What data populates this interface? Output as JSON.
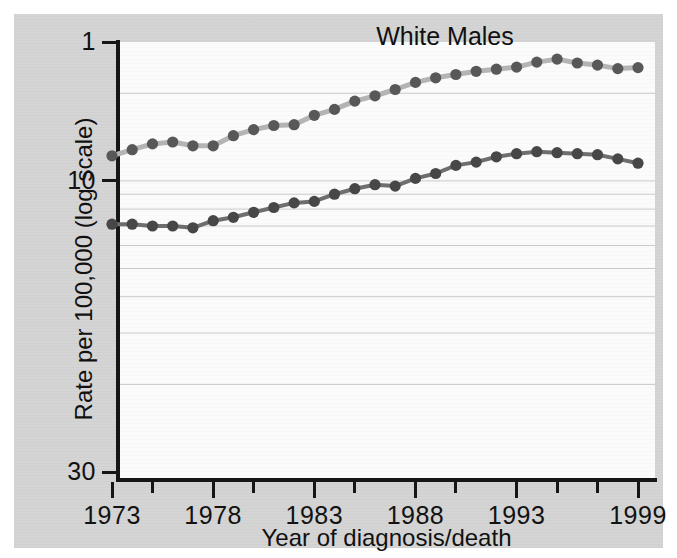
{
  "figure": {
    "background_color": "#d4d4d4",
    "panel_color": "#fbfbfb",
    "title": "White Males"
  },
  "axes": {
    "y_title": "Rate per 100,000 (log scale)",
    "x_title": "Year of diagnosis/death",
    "y_tick_labels": [
      "30",
      "10",
      "1"
    ],
    "x_tick_labels": [
      "1973",
      "1978",
      "1983",
      "1988",
      "1993",
      "1999"
    ]
  },
  "chart_data": {
    "type": "line",
    "title": "White Males",
    "xlabel": "Year of diagnosis/death",
    "ylabel": "Rate per 100,000 (log scale)",
    "yscale": "log",
    "ylim": [
      1,
      33
    ],
    "xlim": [
      1973,
      1999
    ],
    "grid": true,
    "grid_values": [
      2,
      3,
      4,
      5,
      6,
      7,
      8,
      9,
      10,
      20
    ],
    "y_ticks": [
      1,
      10,
      30
    ],
    "x_ticks": [
      1973,
      1978,
      1983,
      1988,
      1993,
      1999
    ],
    "x_minor_ticks": [
      1975,
      1980,
      1985,
      1990,
      1995,
      1997
    ],
    "legend": "none",
    "x": [
      1973,
      1974,
      1975,
      1976,
      1977,
      1978,
      1979,
      1980,
      1981,
      1982,
      1983,
      1984,
      1985,
      1986,
      1987,
      1988,
      1989,
      1990,
      1991,
      1992,
      1993,
      1994,
      1995,
      1996,
      1997,
      1998,
      1999
    ],
    "series": [
      {
        "name": "Incidence",
        "color": "#b4b4b4",
        "marker_color": "#585858",
        "values": [
          12.2,
          12.8,
          13.4,
          13.6,
          13.2,
          13.2,
          14.3,
          15.0,
          15.5,
          15.6,
          16.8,
          17.6,
          18.8,
          19.6,
          20.6,
          21.8,
          22.6,
          23.2,
          23.8,
          24.2,
          24.6,
          25.6,
          26.2,
          25.4,
          25.0,
          24.3,
          24.5
        ]
      },
      {
        "name": "Mortality",
        "color": "#6e6e6e",
        "marker_color": "#474747",
        "values": [
          7.1,
          7.1,
          7.0,
          7.0,
          6.9,
          7.3,
          7.5,
          7.8,
          8.1,
          8.4,
          8.5,
          9.0,
          9.4,
          9.7,
          9.6,
          10.2,
          10.6,
          11.3,
          11.6,
          12.1,
          12.4,
          12.6,
          12.5,
          12.4,
          12.3,
          11.9,
          11.5
        ]
      }
    ]
  }
}
